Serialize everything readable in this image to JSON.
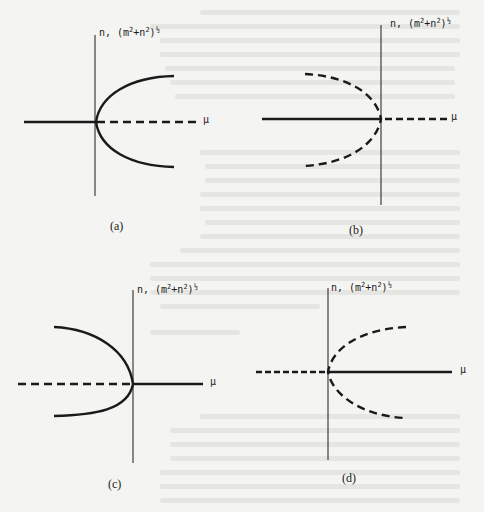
{
  "figure": {
    "style": {
      "ink_color": "#1a1a1a",
      "paper_color": "#f4f4f2",
      "bleed_color": "#d9d9d6"
    },
    "panels": [
      {
        "id": "a",
        "caption": "(a)",
        "y_axis_label": {
          "prefix": "n, (m",
          "sup1": "2",
          "mid": "+n",
          "sup2": "2",
          "close": ")",
          "exp": "½"
        },
        "x_axis_label": "μ",
        "horizontal_axis": {
          "left_segment": "solid",
          "right_segment": "dashed"
        },
        "curve": {
          "shape": "parabola",
          "opens": "right",
          "style": "solid"
        }
      },
      {
        "id": "b",
        "caption": "(b)",
        "y_axis_label": {
          "prefix": "n, (m",
          "sup1": "2",
          "mid": "+n",
          "sup2": "2",
          "close": ")",
          "exp": "½"
        },
        "x_axis_label": "μ",
        "horizontal_axis": {
          "left_segment": "solid",
          "right_segment": "dashed"
        },
        "curve": {
          "shape": "parabola",
          "opens": "left",
          "style": "dashed"
        }
      },
      {
        "id": "c",
        "caption": "(c)",
        "y_axis_label": {
          "prefix": "n, (m",
          "sup1": "2",
          "mid": "+n",
          "sup2": "2",
          "close": ")",
          "exp": "½"
        },
        "x_axis_label": "μ",
        "horizontal_axis": {
          "left_segment": "dashed",
          "right_segment": "solid"
        },
        "curve": {
          "shape": "parabola",
          "opens": "left",
          "style": "solid"
        }
      },
      {
        "id": "d",
        "caption": "(d)",
        "y_axis_label": {
          "prefix": "n, (m",
          "sup1": "2",
          "mid": "+n",
          "sup2": "2",
          "close": ")",
          "exp": "½"
        },
        "x_axis_label": "μ",
        "horizontal_axis": {
          "left_segment": "dashed",
          "right_segment": "solid"
        },
        "curve": {
          "shape": "parabola",
          "opens": "right",
          "style": "dashed"
        }
      }
    ]
  }
}
